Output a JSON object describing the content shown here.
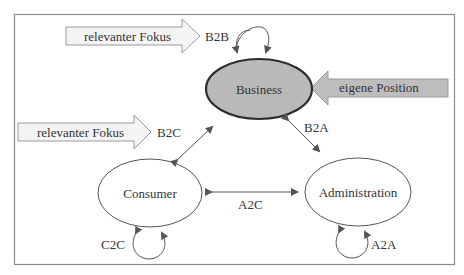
{
  "diagram": {
    "nodes": {
      "business": {
        "label": "Business"
      },
      "consumer": {
        "label": "Consumer"
      },
      "administration": {
        "label": "Administration"
      }
    },
    "edges": {
      "b2b": "B2B",
      "b2c": "B2C",
      "b2a": "B2A",
      "a2c": "A2C",
      "c2c": "C2C",
      "a2a": "A2A"
    },
    "callouts": {
      "focus_top": "relevanter Fokus",
      "focus_left": "relevanter Fokus",
      "own_position": "eigene Position"
    },
    "colors": {
      "frame": "#8a8a8a",
      "business_fill": "#b9b9b9",
      "business_border": "#2e2e2e",
      "line": "#555555",
      "focus_arrow_fill": "#f4f4f4",
      "own_position_fill": "#bdbdbd"
    }
  }
}
